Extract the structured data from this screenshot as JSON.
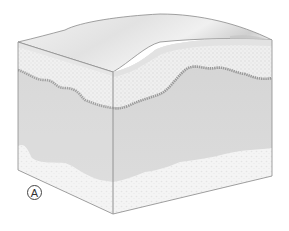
{
  "figure": {
    "panel_label": "A",
    "layers": [
      {
        "name": "stratum-corneum",
        "color": "#e6e6e6"
      },
      {
        "name": "epidermis",
        "color": "#eeeeee"
      },
      {
        "name": "basal-layer",
        "color": "#9a9a9a"
      },
      {
        "name": "dermis",
        "color": "#d6d6d6"
      },
      {
        "name": "subcutaneous-fat",
        "color": "#f3f3f3"
      }
    ],
    "colors": {
      "outline": "#8a8a8a",
      "top_surface": "#e9e9e9",
      "top_shadow": "#c8c8c8",
      "background": "#ffffff"
    }
  }
}
